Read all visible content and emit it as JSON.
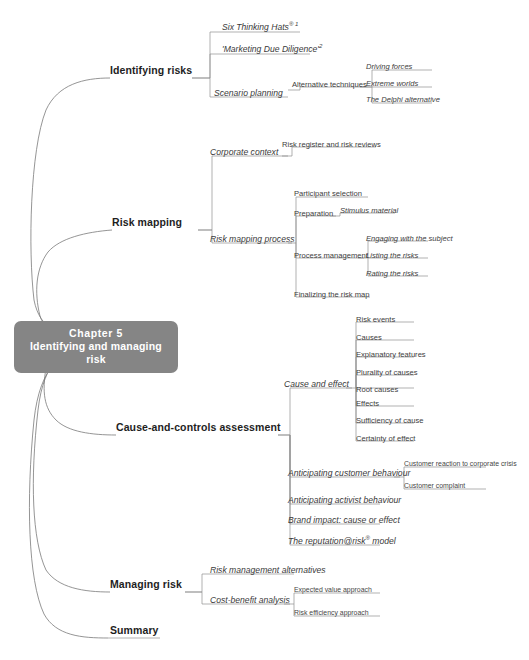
{
  "central": {
    "line1": "Chapter 5",
    "line2": "Identifying and managing risk",
    "color": "#858585",
    "text_color": "#ffffff"
  },
  "branches": [
    {
      "id": "identifying-risks",
      "label": "Identifying risks",
      "children": [
        {
          "id": "six-thinking-hats",
          "label": "Six Thinking Hats",
          "sup": "® 1"
        },
        {
          "id": "marketing-due-diligence",
          "label": "'Marketing Due Diligence'",
          "sup": "2"
        },
        {
          "id": "scenario-planning",
          "label": "Scenario planning",
          "children": [
            {
              "id": "alternative-techniques",
              "label": "Alternative techniques",
              "children": [
                {
                  "id": "driving-forces",
                  "label": "Driving forces"
                },
                {
                  "id": "extreme-worlds",
                  "label": "Extreme worlds"
                },
                {
                  "id": "the-delphi-alternative",
                  "label": "The Delphi alternative"
                }
              ]
            }
          ]
        }
      ]
    },
    {
      "id": "risk-mapping",
      "label": "Risk mapping",
      "children": [
        {
          "id": "corporate-context",
          "label": "Corporate context",
          "children": [
            {
              "id": "risk-register-and-risk-reviews",
              "label": "Risk register and risk reviews"
            }
          ]
        },
        {
          "id": "risk-mapping-process",
          "label": "Risk mapping process",
          "children": [
            {
              "id": "participant-selection",
              "label": "Participant selection"
            },
            {
              "id": "preparation",
              "label": "Preparation",
              "children": [
                {
                  "id": "stimulus-material",
                  "label": "Stimulus material"
                }
              ]
            },
            {
              "id": "process-management",
              "label": "Process management",
              "children": [
                {
                  "id": "engaging-with-the-subject",
                  "label": "Engaging with the subject"
                },
                {
                  "id": "listing-the-risks",
                  "label": "Listing the risks"
                },
                {
                  "id": "rating-the-risks",
                  "label": "Rating the risks"
                }
              ]
            },
            {
              "id": "finalizing-the-risk-map",
              "label": "Finalizing the risk map"
            }
          ]
        }
      ]
    },
    {
      "id": "cause-and-controls-assessment",
      "label": "Cause-and-controls assessment",
      "children": [
        {
          "id": "cause-and-effect",
          "label": "Cause and effect",
          "children": [
            {
              "id": "risk-events",
              "label": "Risk events"
            },
            {
              "id": "causes",
              "label": "Causes"
            },
            {
              "id": "explanatory-features",
              "label": "Explanatory features"
            },
            {
              "id": "plurality-of-causes",
              "label": "Plurality of causes"
            },
            {
              "id": "root-causes",
              "label": "Root causes"
            },
            {
              "id": "effects",
              "label": "Effects"
            },
            {
              "id": "sufficiency-of-cause",
              "label": "Sufficiency of cause"
            },
            {
              "id": "certainty-of-effect",
              "label": "Certainty of effect"
            }
          ]
        },
        {
          "id": "anticipating-customer-behaviour",
          "label": "Anticipating customer behaviour",
          "children": [
            {
              "id": "customer-reaction-to-corporate-crisis",
              "label": "Customer reaction to corporate crisis"
            },
            {
              "id": "customer-complaint",
              "label": "Customer complaint"
            }
          ]
        },
        {
          "id": "anticipating-activist-behaviour",
          "label": "Anticipating activist behaviour"
        },
        {
          "id": "brand-impact-cause-or-effect",
          "label": "Brand impact: cause or effect"
        },
        {
          "id": "the-reputation-at-risk-model",
          "label": "The reputation@risk",
          "sup": "®",
          "label_tail": " model"
        }
      ]
    },
    {
      "id": "managing-risk",
      "label": "Managing risk",
      "children": [
        {
          "id": "risk-management-alternatives",
          "label": "Risk management alternatives"
        },
        {
          "id": "cost-benefit-analysis",
          "label": "Cost-benefit analysis",
          "children": [
            {
              "id": "expected-value-approach",
              "label": "Expected value approach"
            },
            {
              "id": "risk-efficiency-approach",
              "label": "Risk efficiency approach"
            }
          ]
        }
      ]
    },
    {
      "id": "summary",
      "label": "Summary",
      "children": []
    }
  ]
}
